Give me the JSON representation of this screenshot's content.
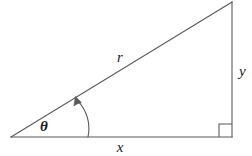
{
  "figure": {
    "name": "right-triangle-polar-coordinates",
    "background_color": "#ffffff",
    "line_color": "#595959",
    "text_color": "#1a1a1a",
    "width": 252,
    "height": 156
  },
  "labels": {
    "hypotenuse": "r",
    "vertical_leg": "y",
    "horizontal_leg": "x",
    "angle": "θ"
  },
  "geometry": {
    "origin_vertex": {
      "x": 11,
      "y": 137
    },
    "right_angle_vertex": {
      "x": 232,
      "y": 137
    },
    "apex_vertex": {
      "x": 232,
      "y": 2
    },
    "right_angle_marker_size": 13,
    "angle_arc": {
      "start": {
        "x": 88,
        "y": 137
      },
      "end": {
        "x": 77,
        "y": 99
      },
      "radius": 40
    }
  },
  "label_positions": {
    "hypotenuse": {
      "x": 120,
      "y": 62
    },
    "vertical_leg": {
      "x": 239,
      "y": 76
    },
    "horizontal_leg": {
      "x": 120,
      "y": 152
    },
    "angle": {
      "x": 44,
      "y": 131
    }
  }
}
